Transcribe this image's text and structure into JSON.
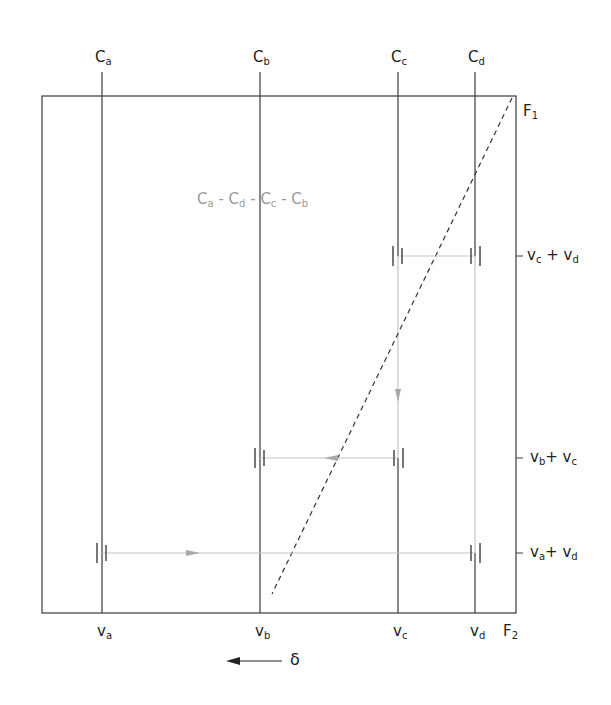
{
  "diagram": {
    "top_labels": [
      {
        "main": "C",
        "sub": "a"
      },
      {
        "main": "C",
        "sub": "b"
      },
      {
        "main": "C",
        "sub": "c"
      },
      {
        "main": "C",
        "sub": "d"
      }
    ],
    "bottom_labels": [
      {
        "main": "v",
        "sub": "a"
      },
      {
        "main": "v",
        "sub": "b"
      },
      {
        "main": "v",
        "sub": "c"
      },
      {
        "main": "v",
        "sub": "d"
      }
    ],
    "axis_labels": {
      "f1": {
        "main": "F",
        "sub": "1"
      },
      "f2": {
        "main": "F",
        "sub": "2"
      }
    },
    "right_labels": [
      {
        "a": "v",
        "a_sub": "c",
        "op": " + ",
        "b": "v",
        "b_sub": "d"
      },
      {
        "a": "v",
        "a_sub": "b",
        "op": "+ ",
        "b": "v",
        "b_sub": "c"
      },
      {
        "a": "v",
        "a_sub": "a",
        "op": "+ ",
        "b": "v",
        "b_sub": "d"
      }
    ],
    "sequence": {
      "parts": [
        {
          "main": "C",
          "sub": "a"
        },
        {
          "main": "C",
          "sub": "d"
        },
        {
          "main": "C",
          "sub": "c"
        },
        {
          "main": "C",
          "sub": "b"
        }
      ],
      "separator": " - "
    },
    "delta_label": "δ",
    "colors": {
      "line": "#3a3a3a",
      "path": "#b5b5b5",
      "sequence_text": "#9a9a9a"
    }
  }
}
